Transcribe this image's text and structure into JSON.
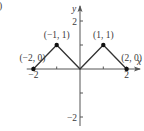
{
  "panel_label": ")",
  "chart_data": {
    "type": "line",
    "title": "",
    "xlabel": "x",
    "ylabel": "y",
    "xlim": [
      -2.2,
      2.5
    ],
    "ylim": [
      -2.4,
      2.7
    ],
    "grid": false,
    "x_ticks": [
      -2,
      -1,
      1,
      2
    ],
    "x_tick_labels": [
      "−2",
      "",
      "",
      "2"
    ],
    "y_ticks": [
      -2,
      -1,
      1,
      2
    ],
    "y_tick_labels": [
      "−2",
      "",
      "",
      "2"
    ],
    "series": [
      {
        "name": "f(x)",
        "x": [
          -2,
          -1,
          0,
          1,
          2
        ],
        "y": [
          0,
          1,
          0,
          1,
          0
        ]
      }
    ],
    "marked_points": [
      {
        "x": -2,
        "y": 0,
        "label": "(−2, 0)"
      },
      {
        "x": -1,
        "y": 1,
        "label": "(−1, 1)"
      },
      {
        "x": 1,
        "y": 1,
        "label": "(1, 1)"
      },
      {
        "x": 2,
        "y": 0,
        "label": "(2, 0)"
      }
    ]
  }
}
